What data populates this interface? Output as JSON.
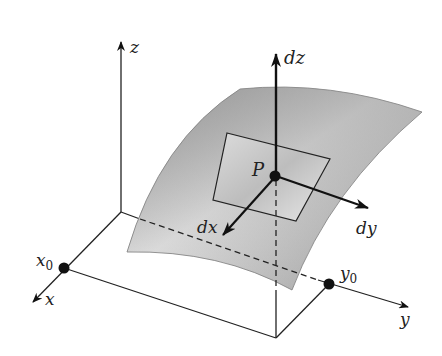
{
  "diagram": {
    "type": "3d-surface-differential",
    "labels": {
      "z_axis": "z",
      "x_axis": "x",
      "y_axis": "y",
      "x0": "x",
      "x0_sub": "0",
      "y0": "y",
      "y0_sub": "0",
      "point": "P",
      "dz": "dz",
      "dx": "dx",
      "dy": "dy"
    },
    "colors": {
      "line": "#222222",
      "surface_light": "#e6e6e6",
      "surface_dark": "#8a8a8a",
      "tangent_plane": "#c8c8c8"
    }
  }
}
